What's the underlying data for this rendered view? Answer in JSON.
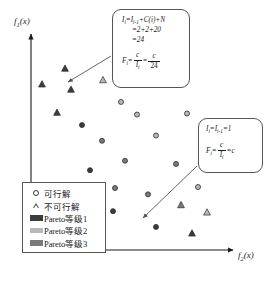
{
  "chart_data": {
    "type": "scatter",
    "title": "",
    "xlabel": "f2(x)",
    "ylabel": "f1(x)",
    "grid": false,
    "legend_position": "bottom-left",
    "xlim": [
      0,
      100
    ],
    "ylim": [
      0,
      100
    ],
    "series": [
      {
        "name": "可行解",
        "marker": "circle",
        "points": [
          {
            "x": 45.0,
            "y": 70.5,
            "rank": 2
          },
          {
            "x": 53.0,
            "y": 64.5,
            "rank": 2
          },
          {
            "x": 78.0,
            "y": 65.0,
            "rank": 2
          },
          {
            "x": 35.5,
            "y": 52.0,
            "rank": 3
          },
          {
            "x": 62.5,
            "y": 54.5,
            "rank": 2
          },
          {
            "x": 88.5,
            "y": 53.0,
            "rank": 2
          },
          {
            "x": 47.0,
            "y": 42.5,
            "rank": 3
          },
          {
            "x": 72.5,
            "y": 41.0,
            "rank": 3
          },
          {
            "x": 29.5,
            "y": 38.0,
            "rank": 1
          },
          {
            "x": 19.0,
            "y": 28.0,
            "rank": 1
          },
          {
            "x": 42.0,
            "y": 29.5,
            "rank": 3
          },
          {
            "x": 58.5,
            "y": 26.5,
            "rank": 3
          },
          {
            "x": 83.5,
            "y": 30.0,
            "rank": 2
          },
          {
            "x": 41.0,
            "y": 18.5,
            "rank": 1
          },
          {
            "x": 62.5,
            "y": 11.0,
            "rank": 1
          },
          {
            "x": 25.5,
            "y": 59.5,
            "rank": 1
          }
        ]
      },
      {
        "name": "不可行解",
        "marker": "triangle",
        "points": [
          {
            "x": 17.0,
            "y": 86.5,
            "rank": 1
          },
          {
            "x": 5.5,
            "y": 79.0,
            "rank": 1
          },
          {
            "x": 20.0,
            "y": 76.5,
            "rank": 1
          },
          {
            "x": 36.0,
            "y": 81.0,
            "rank": 2
          },
          {
            "x": 13.0,
            "y": 65.5,
            "rank": 1
          },
          {
            "x": 75.0,
            "y": 21.5,
            "rank": 3
          },
          {
            "x": 88.0,
            "y": 18.0,
            "rank": 2
          },
          {
            "x": 80.5,
            "y": 8.0,
            "rank": 1
          }
        ]
      }
    ],
    "legend_entries": [
      {
        "label": "可行解",
        "marker": "circle"
      },
      {
        "label": "不可行解",
        "marker": "triangle"
      },
      {
        "label": "Pareto等级1",
        "marker": "swatch",
        "color": "#3c3c3c"
      },
      {
        "label": "Pareto等级2",
        "marker": "swatch",
        "color": "#b8b8b8"
      },
      {
        "label": "Pareto等级3",
        "marker": "swatch",
        "color": "#7a7a7a"
      }
    ],
    "annotations": [
      {
        "id": "callout-1",
        "lines": [
          "I_i = I_i-1 + C(i) + N",
          "= 2+2+20",
          "= 24",
          "F_i = c / I_i = c / 24"
        ],
        "points_to": {
          "x": 17.0,
          "y": 86.5
        }
      },
      {
        "id": "callout-2",
        "lines": [
          "I_i = I_i-1 = 1",
          "F_i = c / I_i = c"
        ],
        "points_to": {
          "x": 41.0,
          "y": 18.5
        }
      }
    ]
  },
  "axes": {
    "ylabel_main": "f",
    "ylabel_sub": "1",
    "ylabel_tail": "(x)",
    "xlabel_main": "f",
    "xlabel_sub": "2",
    "xlabel_tail": "(x)"
  },
  "callout1": {
    "line1_lhs": "I",
    "line1_lhs_sub": "i",
    "line1_eq": "=I",
    "line1_sub2": "i-1",
    "line1_rest": "+C(i)+N",
    "line2": "=2+2+20",
    "line3": "=24",
    "line4_lhs": "F",
    "line4_lhs_sub": "i",
    "line4_eq": "=",
    "frac1_num": "c",
    "frac1_den_main": "I",
    "frac1_den_sub": "i",
    "mid_eq": "=",
    "frac2_num": "c",
    "frac2_den": "24"
  },
  "callout2": {
    "line1_lhs": "I",
    "line1_lhs_sub": "i",
    "line1_eq": "=I",
    "line1_sub2": "i-1",
    "line1_rest": "=1",
    "line2_lhs": "F",
    "line2_lhs_sub": "i",
    "line2_eq": "=",
    "frac_num": "c",
    "frac_den_main": "I",
    "frac_den_sub": "i",
    "tail_eq": "=c"
  },
  "legend": {
    "items": [
      {
        "label": "可行解"
      },
      {
        "label": "不可行解"
      },
      {
        "label": "Pareto等级1"
      },
      {
        "label": "Pareto等级2"
      },
      {
        "label": "Pareto等级3"
      }
    ]
  },
  "colors": {
    "rank1": "#3c3c3c",
    "rank2": "#b8b8b8",
    "rank3": "#7a7a7a",
    "axis": "#1a1a1a",
    "box_border": "#555555"
  }
}
